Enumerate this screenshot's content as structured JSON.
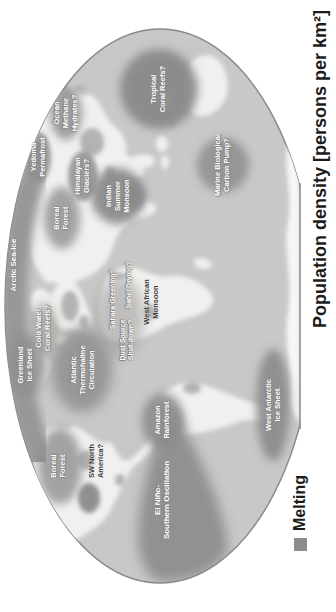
{
  "page": {
    "background": "#ffffff"
  },
  "figure": {
    "caption": "Population density [persons per km²]",
    "legend": {
      "melting": "Melting",
      "melting_swatch_color": "#8d8d8d"
    }
  },
  "map": {
    "projection": "elliptical world map, flattened at Antarctica",
    "colors": {
      "ocean": "#c8c8c7",
      "land": "#f1f0ee",
      "tipping_oval": "#8f8f8f",
      "map_outline": "#8a8a8a",
      "arctic_band": "#979797"
    },
    "labels": {
      "arctic_sea_ice": "Arctic Sea-Ice",
      "greenland_ice_sheet": "Greenland\nIce Sheet",
      "cold_water_coral_reefs": "Cold Water\nCoral Reefs?",
      "boreal_forest_north_america": "Boreal\nForest",
      "sw_north_america": "SW North\nAmerica?",
      "atlantic_thermohaline_circulation": "Atlantic\nThermohaline\nCirculation",
      "yedoma_permafrost": "Yedoma\nPermafrost",
      "boreal_forest_eurasia": "Boreal\nForest",
      "ocean_methane_hydrates": "Ocean\nMethane\nHydrates?",
      "himalayan_glaciers": "Himalayan\nGlaciers?",
      "indian_summer_monsoon": "Indian\nSummer\nMonsoon",
      "sahara_greening": "Sahara Greening?",
      "sahel_drying": "Sahel Drying?",
      "dust_source_shutdown": "Dust Source\nShut-down?",
      "west_african_monsoon": "West African\nMonsoon",
      "amazon_rainforest": "Amazon\nRainforest",
      "el_nino_southern_oscillation": "El Niño-\nSouthern Oscillation",
      "tropical_coral_reefs": "Tropical\nCoral Reefs?",
      "marine_biological_carbon_pump": "Marine Biological\nCarbon Pump?",
      "west_antarctic_ice_sheet": "West Antarctic\nIce Sheet"
    }
  }
}
